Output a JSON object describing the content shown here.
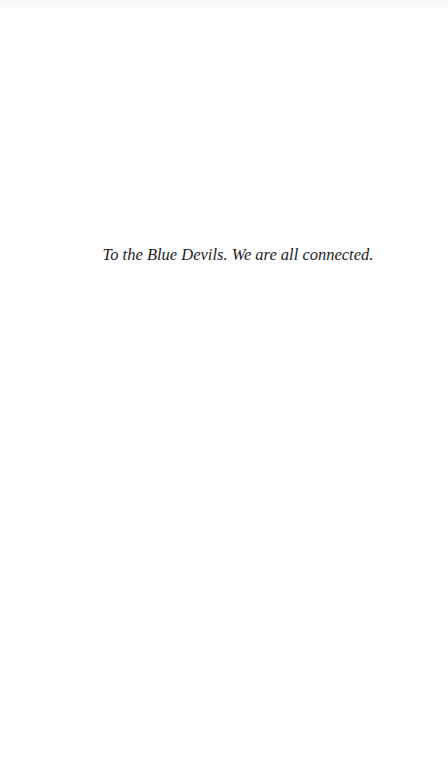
{
  "page": {
    "type": "dedication",
    "background_color": "#ffffff",
    "text_color": "#1e1e1e"
  },
  "dedication": {
    "text": "To the Blue Devils. We are all connected."
  }
}
